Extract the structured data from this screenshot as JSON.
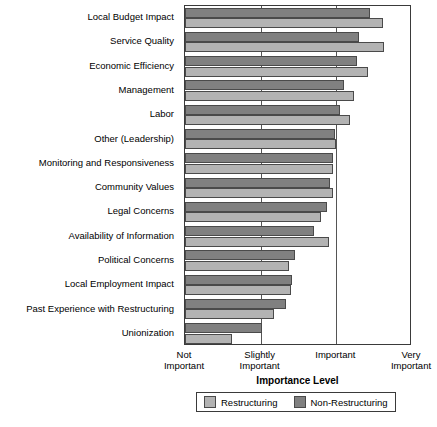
{
  "chart_data": {
    "type": "bar",
    "orientation": "horizontal",
    "title": "",
    "xlabel": "Importance Level",
    "ylabel": "",
    "xlim": [
      1,
      4
    ],
    "grid": true,
    "legend_position": "bottom",
    "tick_labels": [
      "Not\nImportant",
      "Slightly\nImportant",
      "Important",
      "Very\nImportant"
    ],
    "tick_values": [
      1,
      2,
      3,
      4
    ],
    "categories": [
      "Local Budget Impact",
      "Service Quality",
      "Economic Efficiency",
      "Management",
      "Labor",
      "Other (Leadership)",
      "Monitoring and Responsiveness",
      "Community Values",
      "Legal Concerns",
      "Availability of Information",
      "Political Concerns",
      "Local Employment Impact",
      "Past Experience with Restructuring",
      "Unionization"
    ],
    "series": [
      {
        "name": "Non-Restructuring",
        "color": "#808080",
        "values": [
          3.45,
          3.3,
          3.27,
          3.1,
          3.05,
          2.98,
          2.95,
          2.92,
          2.88,
          2.7,
          2.45,
          2.42,
          2.34,
          2.02
        ]
      },
      {
        "name": "Restructuring",
        "color": "#b3b3b3",
        "values": [
          3.62,
          3.63,
          3.42,
          3.23,
          3.18,
          3.0,
          2.96,
          2.95,
          2.8,
          2.9,
          2.38,
          2.4,
          2.18,
          1.62
        ]
      }
    ]
  },
  "legend": {
    "items": [
      {
        "label": "Restructuring",
        "color": "#b3b3b3"
      },
      {
        "label": "Non-Restructuring",
        "color": "#808080"
      }
    ]
  }
}
